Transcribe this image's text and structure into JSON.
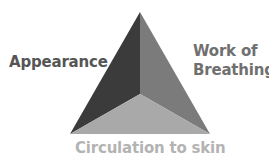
{
  "diagram": {
    "sides": {
      "left": "Appearance",
      "right_line1": "Work of",
      "right_line2": "Breathing",
      "bottom": "Circulation to skin"
    },
    "colors": {
      "left_face": "#3b3b3b",
      "right_face": "#7b7b7b",
      "bottom_face": "#a9a9a9",
      "label_left": "#555555",
      "label_right": "#707070",
      "label_bottom": "#b3b3b3"
    }
  }
}
